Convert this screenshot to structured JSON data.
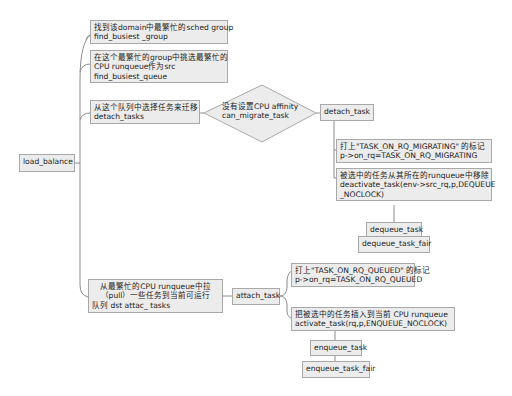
{
  "root": {
    "label": "load_balance"
  },
  "steps": [
    {
      "lines": [
        "找到该domain中最繁忙的sched group",
        "find_busiest _group"
      ]
    },
    {
      "lines": [
        "在这个最繁忙的group中挑选最繁忙的",
        " CPU runqueue作为src",
        "find_busiest_queue"
      ]
    },
    {
      "lines": [
        "从这个队列中选择任务来迁移",
        "detach_tasks"
      ]
    },
    {
      "lines": [
        "从最繁忙的CPU runqueue中拉",
        "（pull）一些任务到当前可运行",
        "队列 dst attac_ tasks"
      ]
    }
  ],
  "decision": {
    "lines": [
      "没有设置CPU affinity",
      "can_migrate_task"
    ]
  },
  "detach": {
    "label": "detach_task",
    "children": [
      {
        "lines": [
          "打上\"TASK_ON_RQ_MIGRATING\" 的标记",
          "p->on_rq=TASK_ON_RQ_MIGRATING"
        ]
      },
      {
        "lines": [
          "被选中的任务从其所在的runqueue中移除",
          " deactivate_task(env->src_rq,p,DEQUEUE",
          "_NOCLOCK)"
        ]
      }
    ],
    "dequeue": "dequeue_task",
    "dequeue_fair": "dequeue_task_fair"
  },
  "attach": {
    "label": "attach_task",
    "children": [
      {
        "lines": [
          "打上\"TASK_ON_RQ_QUEUED\" 的标记",
          "p->on_rq=TASK_ON_RQ_QUEUED"
        ]
      },
      {
        "lines": [
          "把被选中的任务插入到当前 CPU runqueue",
          " activate_task(rq,p,ENQUEUE_NOCLOCK)"
        ]
      }
    ],
    "enqueue": "enqueue_task",
    "enqueue_fair": "enqueue_task_fair"
  },
  "colors": {
    "node_fill": "#ececec",
    "node_border": "#a8a8a8",
    "line": "#8c8c8c"
  }
}
